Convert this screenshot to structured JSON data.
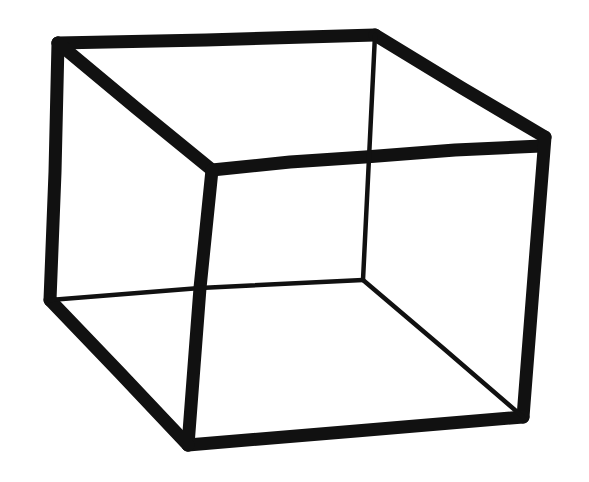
{
  "figure": {
    "name": "necker-cube",
    "style": "hand-drawn ink line drawing",
    "canvas": {
      "width": 589,
      "height": 482,
      "background_color": "#ffffff",
      "ink_color": "#111111"
    },
    "stroke_widths": {
      "thick": 13,
      "medium": 11,
      "thin": 4.5
    },
    "vertices": {
      "A": {
        "label": "top-left-back",
        "x": 58,
        "y": 43
      },
      "B": {
        "label": "top-right-back",
        "x": 375,
        "y": 35
      },
      "C": {
        "label": "right-upper",
        "x": 545,
        "y": 137
      },
      "D": {
        "label": "inner-top-left",
        "x": 212,
        "y": 170
      },
      "E": {
        "label": "inner-top-right-crossing",
        "x": 365,
        "y": 157
      },
      "F": {
        "label": "inner-bottom-right",
        "x": 363,
        "y": 280
      },
      "G": {
        "label": "left-lower-back",
        "x": 50,
        "y": 300
      },
      "H": {
        "label": "inner-left-crossing",
        "x": 200,
        "y": 288
      },
      "I": {
        "label": "bottom-left-front",
        "x": 188,
        "y": 445
      },
      "J": {
        "label": "bottom-right",
        "x": 523,
        "y": 417
      }
    },
    "edges": [
      {
        "name": "top-edge",
        "from": "A",
        "to": "B",
        "weight": "thick",
        "path": "M 58 43 L 206 40 L 375 35"
      },
      {
        "name": "top-right-edge",
        "from": "B",
        "to": "C",
        "weight": "thick",
        "path": "M 375 35 L 462 88 L 545 137"
      },
      {
        "name": "left-vertical-edge",
        "from": "A",
        "to": "G",
        "weight": "thick",
        "path": "M 58 43 L 55 172 L 50 300"
      },
      {
        "name": "diagonal-a-to-d",
        "from": "A",
        "to": "D",
        "weight": "thick",
        "path": "M 58 43 L 136 108 L 212 170"
      },
      {
        "name": "inner-top-horizontal",
        "from": "D",
        "to": "C",
        "weight": "thick",
        "path": "M 212 170 L 290 162 L 365 157 L 455 150 L 541 146"
      },
      {
        "name": "inner-vertical-front",
        "from": "D",
        "to": "I",
        "weight": "thick",
        "path": "M 212 170 L 200 288 L 188 445"
      },
      {
        "name": "right-vertical-edge",
        "from": "C",
        "to": "J",
        "weight": "thick",
        "path": "M 545 137 L 534 276 L 523 417"
      },
      {
        "name": "bottom-edge",
        "from": "I",
        "to": "J",
        "weight": "thick",
        "path": "M 188 445 L 356 431 L 523 417"
      },
      {
        "name": "bottom-left-edge",
        "from": "G",
        "to": "I",
        "weight": "thick",
        "path": "M 50 300 L 120 373 L 188 445"
      },
      {
        "name": "hidden-back-vertical",
        "from": "B",
        "to": "F",
        "weight": "thin",
        "path": "M 375 35 L 369 158 L 363 280"
      },
      {
        "name": "hidden-inner-horizontal",
        "from": "G",
        "to": "F",
        "weight": "thin",
        "path": "M 50 300 L 200 288 L 363 280"
      },
      {
        "name": "hidden-lower-diagonal",
        "from": "F",
        "to": "J",
        "weight": "thin",
        "path": "M 363 280 L 443 348 L 523 417"
      }
    ],
    "crossings": [
      {
        "name": "crossing-upper",
        "x": 365,
        "y": 157,
        "edges": [
          "inner-top-horizontal",
          "hidden-back-vertical"
        ]
      },
      {
        "name": "crossing-lower",
        "x": 200,
        "y": 288,
        "edges": [
          "inner-vertical-front",
          "hidden-inner-horizontal"
        ]
      }
    ]
  },
  "chart_data": {
    "type": "diagram",
    "shape": "cube wireframe (orthographic, ambiguous depth)",
    "vertex_count": 8,
    "edge_count": 12,
    "drawn_edge_count": 12
  }
}
